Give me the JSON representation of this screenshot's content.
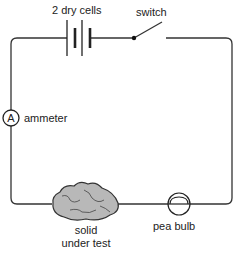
{
  "diagram": {
    "type": "electric-circuit",
    "components": [
      {
        "id": "battery",
        "label": "2 dry cells"
      },
      {
        "id": "switch",
        "label": "switch"
      },
      {
        "id": "ammeter",
        "label": "ammeter",
        "symbol": "A"
      },
      {
        "id": "solid",
        "label_line1": "solid",
        "label_line2": "under test"
      },
      {
        "id": "bulb",
        "label": "pea bulb"
      }
    ],
    "colors": {
      "wire": "#333333",
      "rock_fill": "#b8b8b8",
      "rock_stroke": "#333333"
    }
  }
}
